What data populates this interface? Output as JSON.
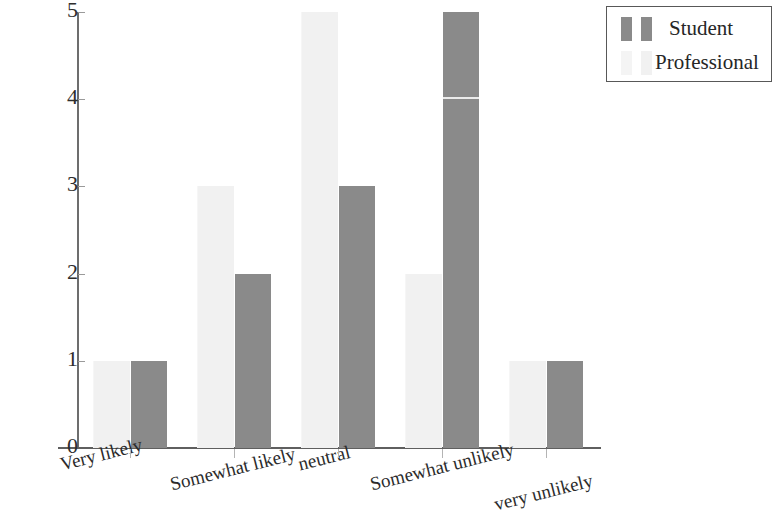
{
  "chart_data": {
    "type": "bar",
    "title": "",
    "subtitle": "",
    "xlabel": "",
    "ylabel": "",
    "categories": [
      "Very likely",
      "Somewhat likely",
      "neutral",
      "Somewhat unlikely",
      "very unlikely"
    ],
    "series": [
      {
        "name": "Professional",
        "color": "#f1f1f1",
        "values": [
          1,
          3,
          5,
          2,
          1
        ]
      },
      {
        "name": "Student",
        "color": "#8a8a8a",
        "values": [
          1,
          2,
          3,
          5,
          1
        ]
      }
    ],
    "ylim": [
      0,
      5
    ],
    "y_ticks": [
      0,
      1,
      2,
      3,
      4,
      5
    ],
    "y_tick_labels": [
      "0",
      "1",
      "2",
      "3",
      "4",
      "5"
    ],
    "grid": false,
    "legend_position": "top-right",
    "bar_grouping": "grouped",
    "series_draw_order": [
      "Professional",
      "Student"
    ]
  },
  "legend": {
    "entries": [
      {
        "label": "Student",
        "color": "#8a8a8a"
      },
      {
        "label": "Professional",
        "color": "#f1f1f1"
      }
    ]
  },
  "axes": {
    "y_tick_labels": [
      "5",
      "4",
      "3",
      "2",
      "1",
      "0"
    ],
    "x_tick_labels": [
      "Very likely",
      "Somewhat likely",
      "neutral",
      "Somewhat unlikely",
      "very unlikely"
    ]
  }
}
